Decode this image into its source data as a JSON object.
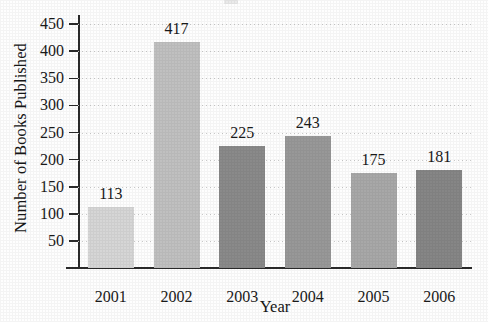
{
  "chart_data": {
    "type": "bar",
    "title": "",
    "xlabel": "Year",
    "ylabel": "Number of Books Published",
    "categories": [
      "2001",
      "2002",
      "2003",
      "2004",
      "2005",
      "2006"
    ],
    "values": [
      113,
      417,
      225,
      243,
      175,
      181
    ],
    "value_labels": [
      "113",
      "417",
      "225",
      "243",
      "175",
      "181"
    ],
    "bar_colors": [
      "#d6d6d6",
      "#c0c0c0",
      "#8a8a8a",
      "#989898",
      "#a8a8a8",
      "#868686"
    ],
    "ylim": [
      0,
      465
    ],
    "ytick_values": [
      50,
      100,
      150,
      200,
      250,
      300,
      350,
      400,
      450
    ],
    "ytick_labels": [
      "50",
      "100",
      "150",
      "200",
      "250",
      "300",
      "350",
      "400",
      "450"
    ],
    "grid": "horizontal-dotted",
    "legend": "none",
    "axis_color": "#2a2a2a",
    "grid_color": "#c9c9c9",
    "background": "#fefefe"
  }
}
